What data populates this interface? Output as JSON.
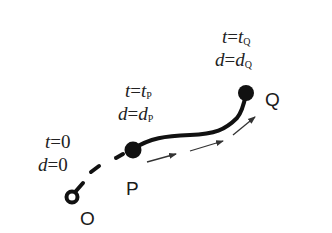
{
  "diagram": {
    "points": [
      {
        "id": "O",
        "label": "O",
        "t_label": "t=0",
        "d_label": "d=0",
        "t_var": "t",
        "t_val": "0",
        "d_var": "d",
        "d_val": "0"
      },
      {
        "id": "P",
        "label": "P",
        "t_var": "t",
        "t_val": "t",
        "t_sub": "P",
        "d_var": "d",
        "d_val": "d",
        "d_sub": "P"
      },
      {
        "id": "Q",
        "label": "Q",
        "t_var": "t",
        "t_val": "t",
        "t_sub": "Q",
        "d_var": "d",
        "d_val": "d",
        "d_sub": "Q"
      }
    ],
    "equals": "=",
    "path_style": {
      "O_to_P": "dashed",
      "P_to_Q": "solid"
    },
    "direction_arrows": 3,
    "colors": {
      "stroke": "#111111",
      "arrow": "#333333",
      "background": "#ffffff"
    }
  }
}
